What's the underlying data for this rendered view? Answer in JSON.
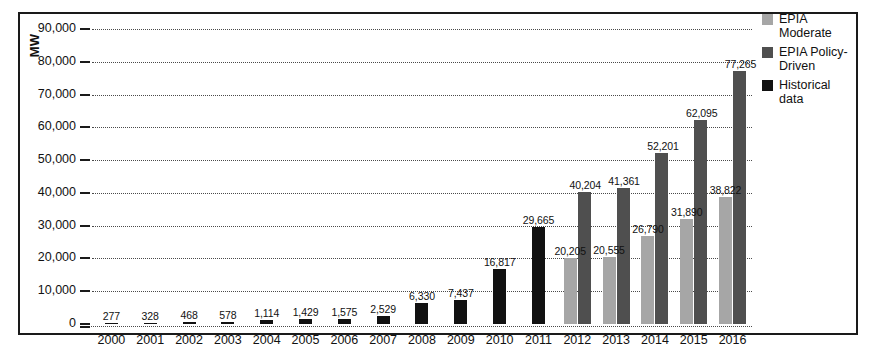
{
  "axis": {
    "y_title": "MW",
    "y_ticks": [
      "90,000",
      "80,000",
      "70,000",
      "60,000",
      "50,000",
      "40,000",
      "30,000",
      "20,000",
      "10,000",
      "0"
    ]
  },
  "legend": {
    "items": [
      {
        "label": "EPIA Moderate",
        "color": "#a6a6a6",
        "swatch": "moderate"
      },
      {
        "label": "EPIA Policy-Driven",
        "color": "#4f4f4f",
        "swatch": "policy"
      },
      {
        "label": "Historical data",
        "color": "#111111",
        "swatch": "historical"
      }
    ]
  },
  "chart_data": {
    "type": "bar",
    "title": "",
    "xlabel": "",
    "ylabel": "MW",
    "ylim": [
      0,
      90000
    ],
    "ytick_step": 10000,
    "grid": true,
    "legend_position": "right",
    "categories": [
      "2000",
      "2001",
      "2002",
      "2003",
      "2004",
      "2005",
      "2006",
      "2007",
      "2008",
      "2009",
      "2010",
      "2011",
      "2012",
      "2013",
      "2014",
      "2015",
      "2016"
    ],
    "series": [
      {
        "name": "Historical data",
        "color": "#111111",
        "values": [
          277,
          328,
          468,
          578,
          1114,
          1429,
          1575,
          2529,
          6330,
          7437,
          16817,
          29665,
          null,
          null,
          null,
          null,
          null
        ],
        "labels": [
          "277",
          "328",
          "468",
          "578",
          "1,114",
          "1,429",
          "1,575",
          "2,529",
          "6,330",
          "7,437",
          "16,817",
          "29,665",
          "",
          "",
          "",
          "",
          ""
        ]
      },
      {
        "name": "EPIA Moderate",
        "color": "#a6a6a6",
        "values": [
          null,
          null,
          null,
          null,
          null,
          null,
          null,
          null,
          null,
          null,
          null,
          null,
          20205,
          20555,
          26790,
          31890,
          38822
        ],
        "labels": [
          "",
          "",
          "",
          "",
          "",
          "",
          "",
          "",
          "",
          "",
          "",
          "",
          "20,205",
          "20,555",
          "26,790",
          "31,890",
          "38,822"
        ]
      },
      {
        "name": "EPIA Policy-Driven",
        "color": "#4f4f4f",
        "values": [
          null,
          null,
          null,
          null,
          null,
          null,
          null,
          null,
          null,
          null,
          null,
          null,
          40204,
          41361,
          52201,
          62095,
          77265
        ],
        "labels": [
          "",
          "",
          "",
          "",
          "",
          "",
          "",
          "",
          "",
          "",
          "",
          "",
          "40,204",
          "41,361",
          "52,201",
          "62,095",
          "77,265"
        ]
      }
    ]
  }
}
